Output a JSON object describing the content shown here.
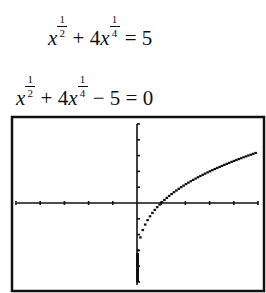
{
  "equations": [
    {
      "id": "original",
      "terms": {
        "base1": "x",
        "exp1_num": "1",
        "exp1_den": "2",
        "op1": " + 4",
        "base2": "x",
        "exp2_num": "1",
        "exp2_den": "4",
        "rest": " = 5"
      }
    },
    {
      "id": "rearranged",
      "terms": {
        "base1": "x",
        "exp1_num": "1",
        "exp1_den": "2",
        "op1": " + 4",
        "base2": "x",
        "exp2_num": "1",
        "exp2_den": "4",
        "rest": " − 5 = 0"
      }
    }
  ],
  "graph": {
    "function": "x^(1/2) + 4x^(1/4) - 5",
    "window": {
      "xmin": -5,
      "xmax": 5,
      "xscl": 1,
      "ymin": -5,
      "ymax": 5,
      "yscl": 1
    },
    "x_intercept": 1,
    "y_at_zero": -5,
    "line_color": "#111111"
  },
  "chart_data": {
    "type": "line",
    "title": "",
    "xlabel": "",
    "ylabel": "",
    "xlim": [
      -5,
      5
    ],
    "ylim": [
      -5,
      5
    ],
    "grid": false,
    "series": [
      {
        "name": "y = x^(1/2) + 4x^(1/4) - 5",
        "x": [
          0,
          0.05,
          0.25,
          0.5,
          1,
          1.5,
          2,
          2.5,
          3,
          3.5,
          4,
          4.5,
          5
        ],
        "y": [
          -5,
          -3.89,
          -2.5,
          -1.93,
          0,
          0.74,
          1.17,
          1.61,
          1.99,
          2.34,
          2.66,
          2.95,
          3.22
        ]
      }
    ]
  }
}
